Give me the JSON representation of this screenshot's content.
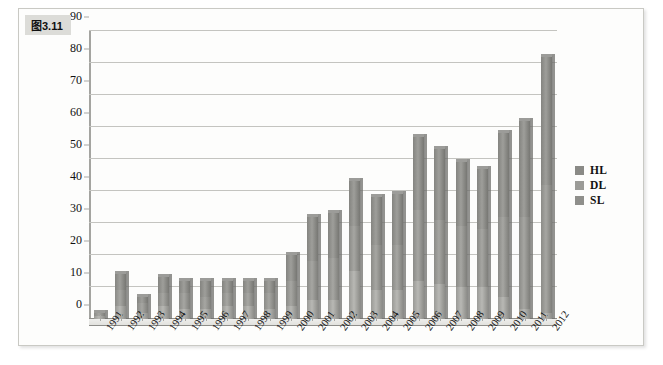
{
  "figure": {
    "tab_label": "图3.11"
  },
  "legend": {
    "position": "right",
    "items": [
      {
        "label": "HL",
        "color": "#8a8a86"
      },
      {
        "label": "DL",
        "color": "#9b9b97"
      },
      {
        "label": "SL",
        "color": "#8f8f8b"
      }
    ]
  },
  "chart_data": {
    "type": "bar",
    "subtype": "stacked-column-3d",
    "title": "图3.11",
    "xlabel": "",
    "ylabel": "",
    "ylim": [
      0,
      90
    ],
    "ytick_step": 10,
    "yticks": [
      90,
      80,
      70,
      60,
      50,
      40,
      30,
      20,
      10,
      0
    ],
    "grid": true,
    "legend_position": "right",
    "categories": [
      "1991",
      "1992",
      "1993",
      "1994",
      "1995",
      "1996",
      "1997",
      "1998",
      "1999",
      "2000",
      "2001",
      "2002",
      "2003",
      "2004",
      "2005",
      "2006",
      "2007",
      "2008",
      "2009",
      "2010",
      "2011",
      "2012"
    ],
    "series": [
      {
        "name": "SL",
        "color": "#9a9a96",
        "values": [
          1,
          4,
          2,
          4,
          3,
          3,
          4,
          4,
          3,
          4,
          6,
          6,
          15,
          9,
          9,
          12,
          11,
          10,
          10,
          7,
          3,
          2
        ]
      },
      {
        "name": "DL",
        "color": "#8b8b87",
        "values": [
          1,
          5,
          3,
          4,
          5,
          4,
          4,
          4,
          5,
          8,
          12,
          13,
          14,
          14,
          14,
          22,
          20,
          19,
          18,
          25,
          29,
          40
        ]
      },
      {
        "name": "HL",
        "color": "#848480",
        "values": [
          0,
          5,
          2,
          5,
          4,
          5,
          4,
          4,
          4,
          8,
          14,
          14,
          14,
          15,
          16,
          23,
          22,
          20,
          19,
          26,
          30,
          40
        ]
      }
    ],
    "totals": [
      2,
      14,
      7,
      13,
      12,
      12,
      12,
      12,
      12,
      20,
      32,
      33,
      43,
      38,
      39,
      57,
      53,
      49,
      47,
      58,
      62,
      82
    ]
  }
}
